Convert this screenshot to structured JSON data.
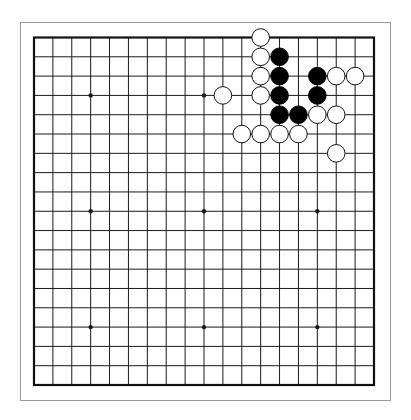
{
  "board": {
    "size": 19,
    "star_points": [
      [
        3,
        3
      ],
      [
        9,
        3
      ],
      [
        15,
        3
      ],
      [
        3,
        9
      ],
      [
        9,
        9
      ],
      [
        15,
        9
      ],
      [
        3,
        15
      ],
      [
        9,
        15
      ],
      [
        15,
        15
      ]
    ],
    "colors": {
      "background": "#ffffff",
      "grid": "#1a1a1a",
      "border": "#111111",
      "frame": "#9a9a9a",
      "black_stone": "#000000",
      "white_stone_fill": "#ffffff",
      "white_stone_edge": "#111111"
    },
    "stones": [
      {
        "color": "white",
        "col": 12,
        "row": 0
      },
      {
        "color": "white",
        "col": 12,
        "row": 1
      },
      {
        "color": "black",
        "col": 13,
        "row": 1
      },
      {
        "color": "white",
        "col": 12,
        "row": 2
      },
      {
        "color": "black",
        "col": 13,
        "row": 2
      },
      {
        "color": "black",
        "col": 15,
        "row": 2
      },
      {
        "color": "white",
        "col": 16,
        "row": 2
      },
      {
        "color": "white",
        "col": 17,
        "row": 2
      },
      {
        "color": "white",
        "col": 10,
        "row": 3
      },
      {
        "color": "white",
        "col": 12,
        "row": 3
      },
      {
        "color": "black",
        "col": 13,
        "row": 3
      },
      {
        "color": "black",
        "col": 15,
        "row": 3
      },
      {
        "color": "black",
        "col": 13,
        "row": 4
      },
      {
        "color": "black",
        "col": 14,
        "row": 4
      },
      {
        "color": "white",
        "col": 15,
        "row": 4
      },
      {
        "color": "white",
        "col": 16,
        "row": 4
      },
      {
        "color": "white",
        "col": 11,
        "row": 5
      },
      {
        "color": "white",
        "col": 12,
        "row": 5
      },
      {
        "color": "white",
        "col": 13,
        "row": 5
      },
      {
        "color": "white",
        "col": 14,
        "row": 5
      },
      {
        "color": "white",
        "col": 16,
        "row": 6
      }
    ]
  }
}
